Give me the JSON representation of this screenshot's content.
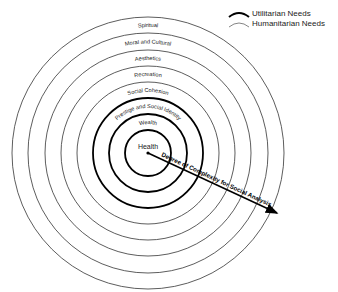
{
  "diagram": {
    "center": {
      "x": 148,
      "y": 153
    },
    "rings": [
      {
        "label": "Health",
        "radius": 23,
        "type": "utilitarian"
      },
      {
        "label": "Wealth",
        "radius": 39,
        "type": "utilitarian"
      },
      {
        "label": "Prestige and Social Identity",
        "radius": 55,
        "type": "utilitarian"
      },
      {
        "label": "Social Cohesion",
        "radius": 71,
        "type": "humanitarian"
      },
      {
        "label": "Recreation",
        "radius": 87,
        "type": "humanitarian"
      },
      {
        "label": "Aesthetics",
        "radius": 103,
        "type": "humanitarian"
      },
      {
        "label": "Moral and Cultural",
        "radius": 120,
        "type": "humanitarian"
      },
      {
        "label": "Spiritual",
        "radius": 136,
        "type": "humanitarian"
      }
    ],
    "arrow_label": "Degree of Complexity for Social Analysis",
    "colors": {
      "line": "#000000",
      "background": "#ffffff"
    }
  },
  "legend": {
    "utilitarian": "Utilitarian Needs",
    "humanitarian": "Humanitarian Needs"
  }
}
